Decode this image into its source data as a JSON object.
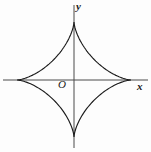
{
  "figure": {
    "title": "",
    "background_color": "#fdfdfd",
    "width": 151,
    "height": 152
  },
  "labels": {
    "x_axis": "x",
    "y_axis": "y",
    "origin": "O"
  },
  "colors": {
    "curve": "#1a1a1a",
    "axis": "#4a4a4a",
    "text": "#1a1a1a",
    "background": "#fdfdfd"
  },
  "chart_data": {
    "type": "line",
    "title": "",
    "subtitle": "",
    "xlabel": "x",
    "ylabel": "y",
    "curve_name": "astroid",
    "equation": "x^(2/3) + y^(2/3) = a^(2/3)",
    "parametric": {
      "x": "a*cos(t)^3",
      "y": "a*sin(t)^3",
      "t_range": [
        0,
        6.283185307
      ]
    },
    "grid": false,
    "legend": null,
    "axes": {
      "origin_pixel": [
        74,
        80
      ],
      "x_axis_pixel_span": [
        3,
        148
      ],
      "y_axis_pixel_span": [
        5,
        148
      ]
    },
    "xlim": [
      -1.32,
      1.32
    ],
    "ylim": [
      -1.32,
      1.32
    ],
    "xticks": [],
    "yticks": [],
    "cusps": {
      "right": [
        1,
        0
      ],
      "top": [
        0,
        1
      ],
      "left": [
        -1,
        0
      ],
      "bottom": [
        0,
        -1
      ]
    },
    "cusps_pixel": {
      "right": [
        131,
        80
      ],
      "top": [
        74,
        22
      ],
      "left": [
        19,
        80
      ],
      "bottom": [
        74,
        137
      ]
    },
    "x": [
      1,
      0.9703,
      0.8796,
      0.7391,
      0.5646,
      0.375,
      0.1895,
      0.0253,
      -0.1084,
      -0.2122,
      -0.2883,
      -0.3403,
      -0.3721,
      -0.3873,
      -0.3894,
      -0.3815,
      -0.3662,
      -0.3457,
      -0.3219,
      -0.2964,
      -0.2704,
      -0.2448,
      -0.2203,
      -0.1973,
      -0.1761,
      -0.1567,
      -0.1392,
      -0.1235,
      -0.1094,
      -0.0969,
      -0.0858,
      -0.0759,
      -0.0672,
      -0.0594,
      -0.0525,
      -0.0464,
      -0.041,
      -0.0362,
      -0.0319,
      -0.0281,
      -0.0247,
      -0.0217,
      -0.0191,
      -0.0167,
      -0.0146,
      -0.0128,
      -0.0111,
      -0.0097,
      -0.0084,
      -0.0073,
      0
    ],
    "y": [
      0,
      0.0001,
      0.0011,
      0.0052,
      0.0152,
      0.0331,
      0.0597,
      0.0945,
      0.1363,
      0.1833,
      0.2334,
      0.2847,
      0.3353,
      0.3837,
      0.4287,
      0.4697,
      0.5062,
      0.5381,
      0.5654,
      0.5884,
      0.6075,
      0.6231,
      0.6357,
      0.6457,
      0.6535,
      0.6594,
      0.6639,
      0.6671,
      0.6693,
      0.6707,
      0.6714,
      0.6716,
      0.6713,
      0.6707,
      0.6699,
      0.6688,
      0.6676,
      0.6663,
      0.6649,
      0.6634,
      0.6619,
      0.6604,
      0.6589,
      0.6574,
      0.6559,
      0.6545,
      0.6531,
      0.6518,
      0.6505,
      0.6492,
      1
    ]
  }
}
